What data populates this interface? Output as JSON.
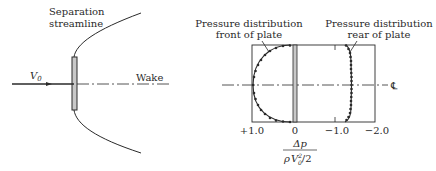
{
  "left_diagram": {
    "separation_label_line1": "Separation",
    "separation_label_line2": "streamline",
    "velocity_label": "V",
    "velocity_subscript": "0",
    "wake_label": "Wake"
  },
  "right_diagram": {
    "front_label_line1": "Pressure distribution",
    "front_label_line2": "front of plate",
    "rear_label_line1": "Pressure distribution",
    "rear_label_line2": "rear of plate",
    "centerline_symbol": "℄",
    "x_ticks": [
      "+1.0",
      "0",
      "−1.0",
      "−2.0"
    ],
    "x_axis_numerator": "Δp",
    "x_axis_denominator_rho": "ρ",
    "x_axis_denominator_V": "V",
    "x_axis_denominator_sup": "2",
    "x_axis_denominator_sub": "0",
    "x_axis_denominator_tail": "/2"
  },
  "colors": {
    "ink": "#2a2a2a",
    "plate_fill": "#c8c8c8",
    "background": "#ffffff"
  }
}
